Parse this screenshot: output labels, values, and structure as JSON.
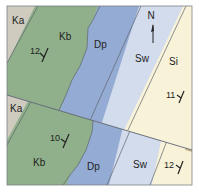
{
  "map": {
    "colors": {
      "Ka": "#cfcbbf",
      "Kb": "#8fb08a",
      "Dp": "#94abd3",
      "Sw": "#d3dcec",
      "Si": "#f8f3d8",
      "Si_edge": "#c9b98e",
      "line": "#5f6470",
      "frame": "#7a7f86"
    },
    "north_arrow": {
      "label": "N"
    },
    "units_upper": [
      {
        "id": "Ka",
        "label": "Ka"
      },
      {
        "id": "Kb",
        "label": "Kb"
      },
      {
        "id": "Dp",
        "label": "Dp"
      },
      {
        "id": "Sw",
        "label": "Sw"
      },
      {
        "id": "Si",
        "label": "Si"
      }
    ],
    "units_lower": [
      {
        "id": "Ka",
        "label": "Ka"
      },
      {
        "id": "Kb",
        "label": "Kb"
      },
      {
        "id": "Dp",
        "label": "Dp"
      },
      {
        "id": "Sw",
        "label": "Sw"
      }
    ],
    "dips": [
      {
        "value": "12",
        "unit": "Kb",
        "block": "upper"
      },
      {
        "value": "11",
        "unit": "Si",
        "block": "upper"
      },
      {
        "value": "10",
        "unit": "Kb",
        "block": "lower"
      },
      {
        "value": "12",
        "unit": "Si",
        "block": "lower"
      }
    ]
  }
}
